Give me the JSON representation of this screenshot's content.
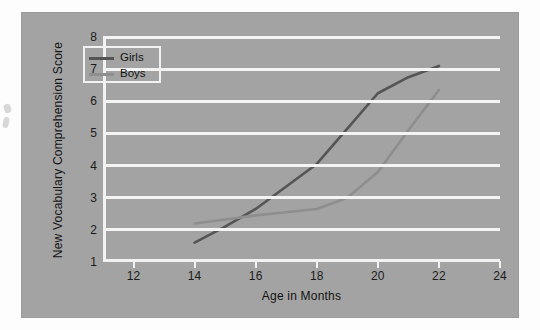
{
  "chart_data": {
    "type": "line",
    "title": "",
    "xlabel": "Age in Months",
    "ylabel": "New Vocabulary Comprehension Score",
    "xlim": [
      11,
      24
    ],
    "ylim": [
      1,
      8
    ],
    "xticks": [
      12,
      14,
      16,
      18,
      20,
      22,
      24
    ],
    "yticks": [
      1,
      2,
      3,
      4,
      5,
      6,
      7,
      8
    ],
    "xtick_labels": [
      "12",
      "14",
      "16",
      "18",
      "20",
      "22",
      "24"
    ],
    "ytick_labels": [
      "1",
      "2",
      "3",
      "4",
      "5",
      "6",
      "7",
      "8"
    ],
    "grid": "horizontal",
    "grid_color": "#f4f4f4",
    "legend_position": "upper-left-inside",
    "plot_background": "#a3a3a3",
    "series": [
      {
        "name": "Girls",
        "color": "#555555",
        "x": [
          14,
          15,
          16,
          17,
          18,
          19,
          20,
          21,
          22
        ],
        "values": [
          1.6,
          2.1,
          2.65,
          3.35,
          4.05,
          5.15,
          6.25,
          6.75,
          7.1
        ]
      },
      {
        "name": "Boys",
        "color": "#8e8e8e",
        "x": [
          14,
          15,
          16,
          17,
          18,
          19,
          20,
          21,
          22
        ],
        "values": [
          2.2,
          2.32,
          2.45,
          2.55,
          2.65,
          3.0,
          3.8,
          5.1,
          6.35
        ]
      }
    ]
  },
  "legend": {
    "entries": [
      {
        "label": "Girls",
        "color": "#555555"
      },
      {
        "label": "Boys",
        "color": "#8e8e8e"
      }
    ]
  },
  "axes": {
    "x_title": "Age in Months",
    "y_title": "New Vocabulary Comprehension Score"
  }
}
